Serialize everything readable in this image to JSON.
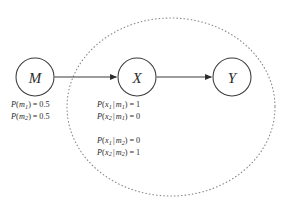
{
  "figure": {
    "background_color": "#ffffff",
    "node_stroke_color": "#3a3a3a",
    "edge_color": "#2b2b2b",
    "plate_color": "#8a8a8a",
    "text_color": "#2b2b2b"
  },
  "nodes": [
    {
      "id": "M",
      "label": "M",
      "cx": 35,
      "cy": 77,
      "r": 19
    },
    {
      "id": "X",
      "label": "X",
      "cx": 137,
      "cy": 77,
      "r": 19
    },
    {
      "id": "Y",
      "label": "Y",
      "cx": 232,
      "cy": 77,
      "r": 19
    }
  ],
  "edges": [
    {
      "id": "M-to-X",
      "from": "M",
      "to": "X",
      "arrowhead": "filled-triangle"
    },
    {
      "id": "X-to-Y",
      "from": "X",
      "to": "Y",
      "arrowhead": "filled-triangle"
    }
  ],
  "plate": {
    "shape": "ellipse",
    "style": "dotted",
    "cx": 171,
    "cy": 107,
    "rx": 104,
    "ry": 89,
    "encloses": [
      "X",
      "Y"
    ]
  },
  "cpt_prior": {
    "lines": [
      {
        "fn": "P",
        "var": "m",
        "var_sub": "1",
        "eq": "=",
        "value": "0.5"
      },
      {
        "fn": "P",
        "var": "m",
        "var_sub": "2",
        "eq": "=",
        "value": "0.5"
      }
    ]
  },
  "cpt_cond_a": {
    "lines": [
      {
        "fn": "P",
        "var": "x",
        "var_sub": "1",
        "given": "m",
        "given_sub": "1",
        "eq": "=",
        "value": "1"
      },
      {
        "fn": "P",
        "var": "x",
        "var_sub": "2",
        "given": "m",
        "given_sub": "1",
        "eq": "=",
        "value": "0"
      }
    ]
  },
  "cpt_cond_b": {
    "lines": [
      {
        "fn": "P",
        "var": "x",
        "var_sub": "1",
        "given": "m",
        "given_sub": "2",
        "eq": "=",
        "value": "0"
      },
      {
        "fn": "P",
        "var": "x",
        "var_sub": "2",
        "given": "m",
        "given_sub": "2",
        "eq": "=",
        "value": "1"
      }
    ]
  },
  "symbols": {
    "conditional_bar": "|",
    "open_paren": "(",
    "close_paren": ")"
  }
}
